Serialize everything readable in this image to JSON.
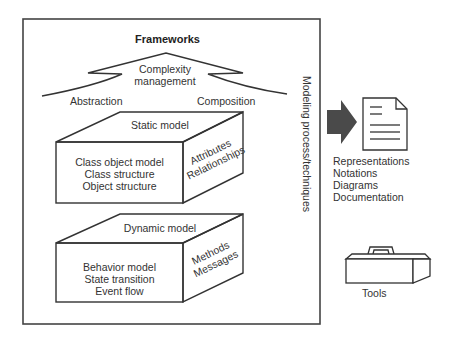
{
  "frame": {
    "title": "Frameworks",
    "side_label": "Modeling process/techniques"
  },
  "arrow": {
    "label_line1": "Complexity",
    "label_line2": "management",
    "left_label": "Abstraction",
    "right_label": "Composition"
  },
  "static_model": {
    "top_label": "Static model",
    "front_lines": [
      "Class object model",
      "Class structure",
      "Object structure"
    ],
    "side_lines": [
      "Attributes",
      "Relationships"
    ]
  },
  "dynamic_model": {
    "top_label": "Dynamic model",
    "front_lines": [
      "Behavior model",
      "State transition",
      "Event flow"
    ],
    "side_lines": [
      "Methods",
      "Messages"
    ]
  },
  "outputs": {
    "icon": "document-icon",
    "lines": [
      "Representations",
      "Notations",
      "Diagrams",
      "Documentation"
    ]
  },
  "tools": {
    "icon": "toolbox-icon",
    "label": "Tools"
  },
  "colors": {
    "line": "#333333",
    "arrow_fill": "#4a4a4a"
  }
}
